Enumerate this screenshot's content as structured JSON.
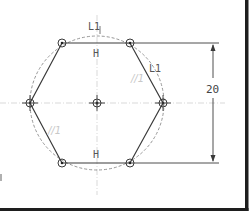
{
  "sketch": {
    "colors": {
      "geometry": "#3a3a3a",
      "construction": "#8a8a8a",
      "centerline": "#cfcfcf",
      "frame": "#1e1e1e",
      "faint_label": "#c8c8c8"
    },
    "center": {
      "x": 97,
      "y": 103
    },
    "circle_radius": 67,
    "vertices": [
      {
        "x": 62,
        "y": 43
      },
      {
        "x": 130,
        "y": 43
      },
      {
        "x": 163,
        "y": 103
      },
      {
        "x": 130,
        "y": 163
      },
      {
        "x": 62,
        "y": 163
      },
      {
        "x": 30,
        "y": 103
      }
    ],
    "constraint_labels": {
      "top_tangent": "L1",
      "top_horizontal": "H",
      "bottom_horizontal": "H",
      "right_tangent": "L1",
      "right_parallel": "//1",
      "left_parallel": "//1"
    },
    "dimension": {
      "value": "20"
    }
  }
}
